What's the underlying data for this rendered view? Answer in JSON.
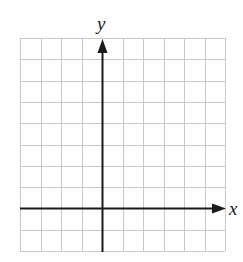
{
  "figure": {
    "type": "coordinate-grid",
    "x_axis_label": "x",
    "y_axis_label": "y",
    "grid": {
      "columns": 10,
      "rows": 10,
      "origin_column": 4,
      "origin_row_from_top": 8
    },
    "colors": {
      "grid_line": "#c8c8c8",
      "axis_line": "#1a1a1a",
      "background": "#ffffff"
    }
  }
}
